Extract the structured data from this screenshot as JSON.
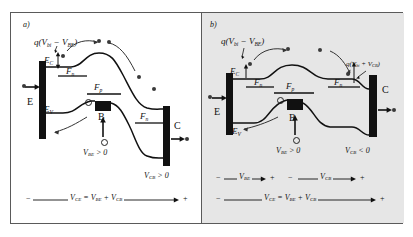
{
  "figure": {
    "background": "#ffffff",
    "border_color": "#5a5a5a",
    "panel_b_background": "#e6e6e6"
  },
  "panels": [
    {
      "id": "a",
      "tag": "a)",
      "mode": "forward-active-saturation",
      "barrier_label": {
        "prefix": "q(",
        "v1": "V",
        "v1_sub": "bi",
        "minus": " − ",
        "v2": "V",
        "v2_sub": "BE",
        "suffix": ")"
      },
      "band_labels": [
        {
          "name": "conduction-band",
          "text": "E",
          "sub": "C"
        },
        {
          "name": "valence-band",
          "text": "E",
          "sub": "V"
        },
        {
          "name": "electron-quasi-fermi",
          "text": "F",
          "sub": "n"
        },
        {
          "name": "hole-quasi-fermi",
          "text": "F",
          "sub": "p"
        },
        {
          "name": "collector-quasi-fermi",
          "text": "F",
          "sub": "n"
        }
      ],
      "terminals": [
        {
          "name": "emitter",
          "label": "E"
        },
        {
          "name": "base",
          "label": "B"
        },
        {
          "name": "collector",
          "label": "C"
        }
      ],
      "bias": [
        {
          "name": "vbe",
          "v": "V",
          "sub": "BE",
          "rel": " > 0"
        },
        {
          "name": "vcb",
          "v": "V",
          "sub": "CB",
          "rel": " > 0"
        }
      ],
      "bottom_axis": {
        "minus": "−",
        "plus": "+",
        "equation_lhs": "V",
        "equation_lhs_sub": "CE",
        "equals": " = ",
        "rhs1": "V",
        "rhs1_sub": "BE",
        "plus_sign": " + ",
        "rhs2": "V",
        "rhs2_sub": "CB"
      },
      "rows": 1
    },
    {
      "id": "b",
      "tag": "b)",
      "mode": "forward-active",
      "barrier_label": {
        "prefix": "q(",
        "v1": "V",
        "v1_sub": "bi",
        "minus": " − ",
        "v2": "V",
        "v2_sub": "BE",
        "suffix": ")"
      },
      "collector_barrier_label": {
        "prefix": "q(",
        "v1": "V",
        "v1_sub": "bi",
        "plus": " + ",
        "v2": "V",
        "v2_sub": "CB",
        "suffix": ")"
      },
      "band_labels": [
        {
          "name": "conduction-band",
          "text": "E",
          "sub": "C"
        },
        {
          "name": "valence-band",
          "text": "E",
          "sub": "V"
        },
        {
          "name": "electron-quasi-fermi",
          "text": "F",
          "sub": "n"
        },
        {
          "name": "hole-quasi-fermi",
          "text": "F",
          "sub": "p"
        },
        {
          "name": "collector-quasi-fermi",
          "text": "F",
          "sub": "n"
        }
      ],
      "terminals": [
        {
          "name": "emitter",
          "label": "E"
        },
        {
          "name": "base",
          "label": "B"
        },
        {
          "name": "collector",
          "label": "C"
        }
      ],
      "bias": [
        {
          "name": "vbe",
          "v": "V",
          "sub": "BE",
          "rel": " > 0"
        },
        {
          "name": "vcb",
          "v": "V",
          "sub": "CB",
          "rel": " < 0"
        }
      ],
      "bottom_axis_top": [
        {
          "name": "vbe-span",
          "minus": "−",
          "v": "V",
          "sub": "BE",
          "plus": "+"
        },
        {
          "name": "vcb-span",
          "minus": "−",
          "v": "V",
          "sub": "CB",
          "plus": "+"
        }
      ],
      "bottom_axis": {
        "minus": "−",
        "plus": "+",
        "equation_lhs": "V",
        "equation_lhs_sub": "CE",
        "equals": " = ",
        "rhs1": "V",
        "rhs1_sub": "BE",
        "plus_sign": " + ",
        "rhs2": "V",
        "rhs2_sub": "CB"
      },
      "rows": 2
    }
  ],
  "icons": {
    "electron": "filled-circle",
    "hole": "open-circle",
    "current_arrow": "arrow-right",
    "bias_arrow": "arrow-up"
  }
}
